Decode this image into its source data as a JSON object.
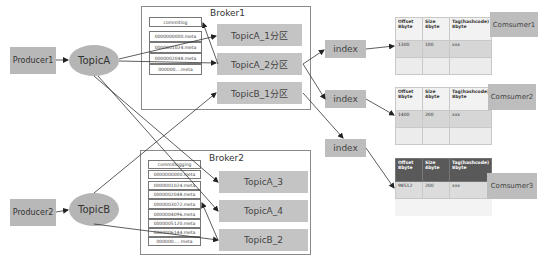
{
  "producers": [
    {
      "label": "Producer1"
    },
    {
      "label": "Producer2"
    }
  ],
  "topics": [
    {
      "label": "TopicA"
    },
    {
      "label": "TopicB"
    }
  ],
  "brokers": [
    {
      "title": "Broker1",
      "commitlog": "commitlog",
      "meta_files": [
        "0000000000.meta",
        "0000001024.meta",
        "0000002048.meta",
        "000000....meta"
      ],
      "partitions": [
        "TopicA_1分区",
        "TopicA_2分区",
        "TopicB_1分区"
      ]
    },
    {
      "title": "Broker2",
      "commitlog": "commitlogging",
      "meta_files": [
        "0000000000.meta",
        "0000001024.meta",
        "0000002048.meta",
        "0000003072.meta",
        "0000004096.meta",
        "0000005120.meta",
        "0000006144.meta",
        "000000.... meta"
      ],
      "partitions": [
        "TopicA_3",
        "TopicA_4",
        "TopicB_2"
      ]
    }
  ],
  "indexes": [
    {
      "label": "index"
    },
    {
      "label": "index"
    },
    {
      "label": "index"
    }
  ],
  "index_tables": [
    {
      "headers": [
        "Offset 8byte",
        "Size 4byte",
        "Tag(hashcode) 8byte"
      ],
      "rows": [
        [
          "1300",
          "100",
          "xxx"
        ],
        [
          "",
          "",
          ""
        ]
      ]
    },
    {
      "headers": [
        "Offset 8byte",
        "Size 4byte",
        "Tag(hashcode) 8byte"
      ],
      "rows": [
        [
          "1400",
          "200",
          "xxx"
        ],
        [
          "",
          "",
          ""
        ]
      ]
    },
    {
      "headers": [
        "Offset 8byte",
        "Size 4byte",
        "Tag(hashcode) 8byte"
      ],
      "rows": [
        [
          "98512",
          "200",
          "xxx"
        ],
        [
          "",
          "",
          ""
        ]
      ]
    }
  ],
  "consumers": [
    {
      "label": "Comsumer1"
    },
    {
      "label": "Comsumer2"
    },
    {
      "label": "Comsumer3"
    }
  ]
}
